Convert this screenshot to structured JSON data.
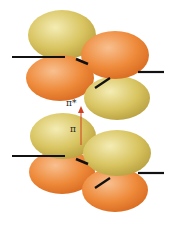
{
  "diagram": {
    "type": "molecular-orbital",
    "upper_orbital": {
      "label": "π*",
      "name": "pi-star-antibonding"
    },
    "lower_orbital": {
      "label": "π",
      "name": "pi-bonding"
    },
    "transition": {
      "from": "π",
      "to": "π*",
      "arrow_color": "#d04020"
    },
    "colors": {
      "yellow_lobe": "#d8c460",
      "yellow_highlight": "#f2e8a8",
      "orange_lobe": "#ee8a3a",
      "orange_highlight": "#f8c090",
      "bond_line": "#111111"
    }
  }
}
